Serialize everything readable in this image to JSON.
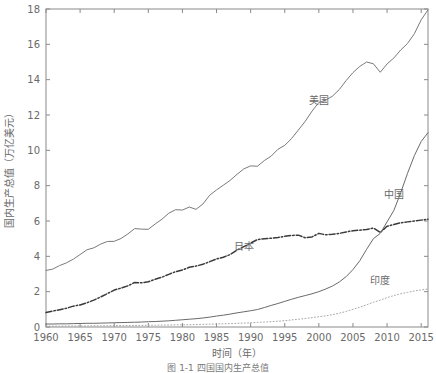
{
  "figure": {
    "caption": "图 1-1  四国国内生产总值",
    "background": "#ffffff",
    "axis_color": "#8a8a8a",
    "text_color": "#6a6a6a"
  },
  "chart_data": {
    "type": "line",
    "title": "",
    "xlabel": "时间（年）",
    "ylabel": "国内生产总值（万亿美元）",
    "xlim": [
      1960,
      2016
    ],
    "ylim": [
      0,
      18
    ],
    "xticks": [
      1960,
      1965,
      1970,
      1975,
      1980,
      1985,
      1990,
      1995,
      2000,
      2005,
      2010,
      2015
    ],
    "yticks": [
      0,
      2,
      4,
      6,
      8,
      10,
      12,
      14,
      16,
      18
    ],
    "grid": false,
    "legend": "inline-annotations",
    "x": [
      1960,
      1961,
      1962,
      1963,
      1964,
      1965,
      1966,
      1967,
      1968,
      1969,
      1970,
      1971,
      1972,
      1973,
      1974,
      1975,
      1976,
      1977,
      1978,
      1979,
      1980,
      1981,
      1982,
      1983,
      1984,
      1985,
      1986,
      1987,
      1988,
      1989,
      1990,
      1991,
      1992,
      1993,
      1994,
      1995,
      1996,
      1997,
      1998,
      1999,
      2000,
      2001,
      2002,
      2003,
      2004,
      2005,
      2006,
      2007,
      2008,
      2009,
      2010,
      2011,
      2012,
      2013,
      2014,
      2015,
      2016
    ],
    "series": [
      {
        "name": "美国",
        "label": "美国",
        "color": "#7a7a7a",
        "style": "solid",
        "label_x": 2000,
        "label_y": 12.6,
        "values": [
          3.2,
          3.28,
          3.48,
          3.63,
          3.84,
          4.1,
          4.37,
          4.48,
          4.69,
          4.84,
          4.85,
          5.01,
          5.27,
          5.57,
          5.54,
          5.53,
          5.83,
          6.1,
          6.44,
          6.64,
          6.62,
          6.79,
          6.66,
          6.96,
          7.46,
          7.76,
          8.03,
          8.3,
          8.64,
          8.95,
          9.12,
          9.1,
          9.42,
          9.67,
          10.06,
          10.28,
          10.67,
          11.15,
          11.64,
          12.22,
          12.71,
          12.84,
          13.07,
          13.44,
          13.95,
          14.4,
          14.75,
          15.0,
          14.9,
          14.42,
          14.89,
          15.23,
          15.68,
          16.05,
          16.6,
          17.39,
          17.95
        ]
      },
      {
        "name": "日本",
        "label": "日本",
        "color": "#3a3a3a",
        "style": "dashdot",
        "label_x": 1989,
        "label_y": 4.35,
        "values": [
          0.82,
          0.9,
          0.98,
          1.06,
          1.18,
          1.25,
          1.37,
          1.52,
          1.7,
          1.89,
          2.09,
          2.2,
          2.33,
          2.52,
          2.5,
          2.56,
          2.7,
          2.82,
          2.98,
          3.13,
          3.23,
          3.38,
          3.45,
          3.55,
          3.7,
          3.85,
          3.95,
          4.1,
          4.35,
          4.55,
          4.75,
          4.95,
          5.0,
          5.02,
          5.07,
          5.13,
          5.18,
          5.2,
          5.05,
          5.1,
          5.3,
          5.22,
          5.25,
          5.3,
          5.38,
          5.45,
          5.48,
          5.52,
          5.6,
          5.35,
          5.7,
          5.8,
          5.9,
          5.95,
          6.0,
          6.05,
          6.1
        ]
      },
      {
        "name": "中国",
        "label": "中国",
        "color": "#6a6a6a",
        "style": "solid",
        "label_x": 2011,
        "label_y": 7.3,
        "values": [
          0.17,
          0.17,
          0.18,
          0.18,
          0.19,
          0.2,
          0.21,
          0.21,
          0.22,
          0.23,
          0.24,
          0.25,
          0.26,
          0.27,
          0.28,
          0.3,
          0.31,
          0.33,
          0.35,
          0.38,
          0.41,
          0.44,
          0.47,
          0.51,
          0.56,
          0.62,
          0.67,
          0.73,
          0.8,
          0.86,
          0.92,
          0.99,
          1.1,
          1.22,
          1.33,
          1.45,
          1.57,
          1.68,
          1.78,
          1.88,
          2.0,
          2.15,
          2.32,
          2.55,
          2.85,
          3.25,
          3.75,
          4.4,
          5.0,
          5.3,
          5.95,
          6.6,
          7.6,
          8.7,
          9.7,
          10.5,
          11.0
        ]
      },
      {
        "name": "印度",
        "label": "印度",
        "color": "#a9a9a9",
        "style": "dotted",
        "label_x": 2009,
        "label_y": 2.45,
        "values": [
          0.05,
          0.05,
          0.05,
          0.06,
          0.06,
          0.06,
          0.06,
          0.07,
          0.07,
          0.07,
          0.08,
          0.08,
          0.08,
          0.09,
          0.09,
          0.1,
          0.1,
          0.11,
          0.11,
          0.12,
          0.12,
          0.13,
          0.14,
          0.15,
          0.16,
          0.17,
          0.18,
          0.19,
          0.21,
          0.22,
          0.24,
          0.26,
          0.28,
          0.3,
          0.33,
          0.36,
          0.4,
          0.44,
          0.48,
          0.53,
          0.58,
          0.63,
          0.7,
          0.78,
          0.88,
          1.0,
          1.12,
          1.26,
          1.4,
          1.52,
          1.66,
          1.78,
          1.88,
          1.96,
          2.04,
          2.1,
          2.15
        ]
      }
    ]
  }
}
